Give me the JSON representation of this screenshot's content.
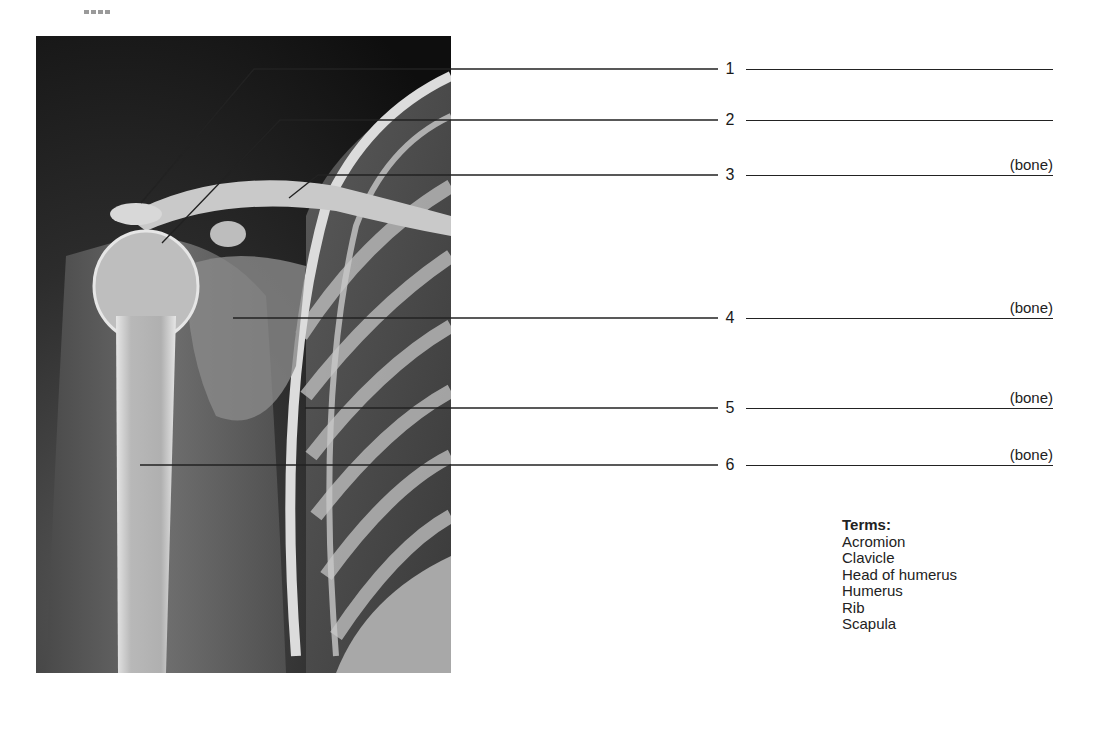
{
  "figure": {
    "labels": [
      {
        "number": "1",
        "hint": ""
      },
      {
        "number": "2",
        "hint": ""
      },
      {
        "number": "3",
        "hint": "(bone)"
      },
      {
        "number": "4",
        "hint": "(bone)"
      },
      {
        "number": "5",
        "hint": "(bone)"
      },
      {
        "number": "6",
        "hint": "(bone)"
      }
    ]
  },
  "terms": {
    "title": "Terms:",
    "items": [
      "Acromion",
      "Clavicle",
      "Head of humerus",
      "Humerus",
      "Rib",
      "Scapula"
    ]
  }
}
